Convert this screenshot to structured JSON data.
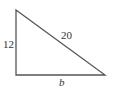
{
  "diagram": {
    "type": "right-triangle",
    "labels": {
      "left_side": "12",
      "hypotenuse": "20",
      "base": "b"
    },
    "stroke_color": "#555555"
  }
}
